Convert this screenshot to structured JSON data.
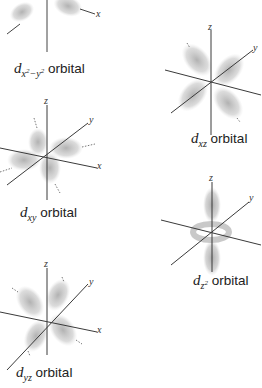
{
  "orbitals": [
    {
      "id": "dx2-y2",
      "prefix": "d",
      "subscript_main": "x",
      "sub_sup1": "2",
      "sub_mid": "−y",
      "sub_sup2": "2",
      "suffix": "orbital",
      "axes": [
        "x"
      ]
    },
    {
      "id": "dxz",
      "prefix": "d",
      "subscript": "xz",
      "suffix": "orbital",
      "axes": [
        "z",
        "y"
      ]
    },
    {
      "id": "dxy",
      "prefix": "d",
      "subscript": "xy",
      "suffix": "orbital",
      "axes": [
        "z",
        "y",
        "x"
      ]
    },
    {
      "id": "dz2",
      "prefix": "d",
      "subscript": "z",
      "sup": "2",
      "suffix": "orbital",
      "axes": [
        "z",
        "y"
      ]
    },
    {
      "id": "dyz",
      "prefix": "d",
      "subscript": "yz",
      "suffix": "orbital",
      "axes": [
        "z",
        "y",
        "x"
      ]
    }
  ],
  "colors": {
    "axis": "#3a3a3a",
    "lobe": "#b8b8b8",
    "text": "#222222"
  }
}
